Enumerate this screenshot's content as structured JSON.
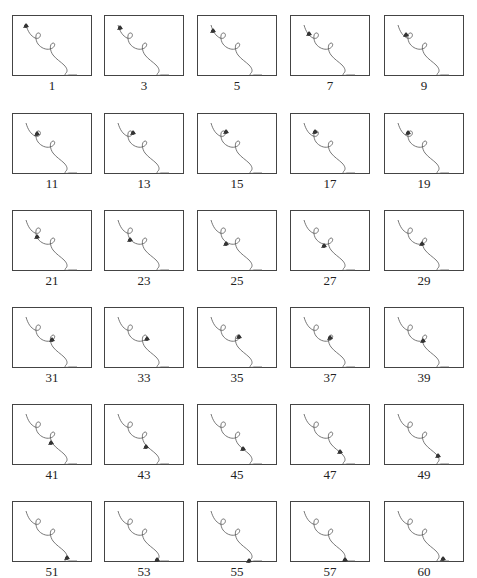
{
  "figure": {
    "line_color": "#555555",
    "marker_color": "#333333",
    "frames": [
      {
        "label": "1",
        "marker": [
          13,
          10
        ]
      },
      {
        "label": "3",
        "marker": [
          15,
          12
        ]
      },
      {
        "label": "5",
        "marker": [
          15,
          15
        ]
      },
      {
        "label": "7",
        "marker": [
          18,
          18
        ]
      },
      {
        "label": "9",
        "marker": [
          21,
          19
        ]
      },
      {
        "label": "11",
        "marker": [
          24,
          20
        ]
      },
      {
        "label": "13",
        "marker": [
          28,
          19
        ]
      },
      {
        "label": "15",
        "marker": [
          28,
          18
        ]
      },
      {
        "label": "17",
        "marker": [
          24,
          18
        ]
      },
      {
        "label": "19",
        "marker": [
          23,
          19
        ]
      },
      {
        "label": "21",
        "marker": [
          24,
          26
        ]
      },
      {
        "label": "23",
        "marker": [
          25,
          29
        ]
      },
      {
        "label": "25",
        "marker": [
          28,
          33
        ]
      },
      {
        "label": "27",
        "marker": [
          33,
          35
        ]
      },
      {
        "label": "29",
        "marker": [
          37,
          33
        ]
      },
      {
        "label": "31",
        "marker": [
          39,
          32
        ]
      },
      {
        "label": "33",
        "marker": [
          42,
          31
        ]
      },
      {
        "label": "35",
        "marker": [
          41,
          29
        ]
      },
      {
        "label": "37",
        "marker": [
          39,
          30
        ]
      },
      {
        "label": "39",
        "marker": [
          38,
          33
        ]
      },
      {
        "label": "41",
        "marker": [
          38,
          38
        ]
      },
      {
        "label": "43",
        "marker": [
          41,
          42
        ]
      },
      {
        "label": "45",
        "marker": [
          45,
          44
        ]
      },
      {
        "label": "47",
        "marker": [
          49,
          47
        ]
      },
      {
        "label": "49",
        "marker": [
          53,
          51
        ]
      },
      {
        "label": "51",
        "marker": [
          54,
          56
        ]
      },
      {
        "label": "53",
        "marker": [
          52,
          58
        ]
      },
      {
        "label": "55",
        "marker": [
          51,
          59
        ]
      },
      {
        "label": "57",
        "marker": [
          54,
          58
        ]
      },
      {
        "label": "60",
        "marker": [
          58,
          57
        ]
      }
    ]
  },
  "layout": {
    "col_x": [
      12,
      104,
      197,
      290,
      384
    ],
    "row_y": [
      15,
      113,
      210,
      307,
      404,
      501
    ],
    "label_dy": 63
  }
}
